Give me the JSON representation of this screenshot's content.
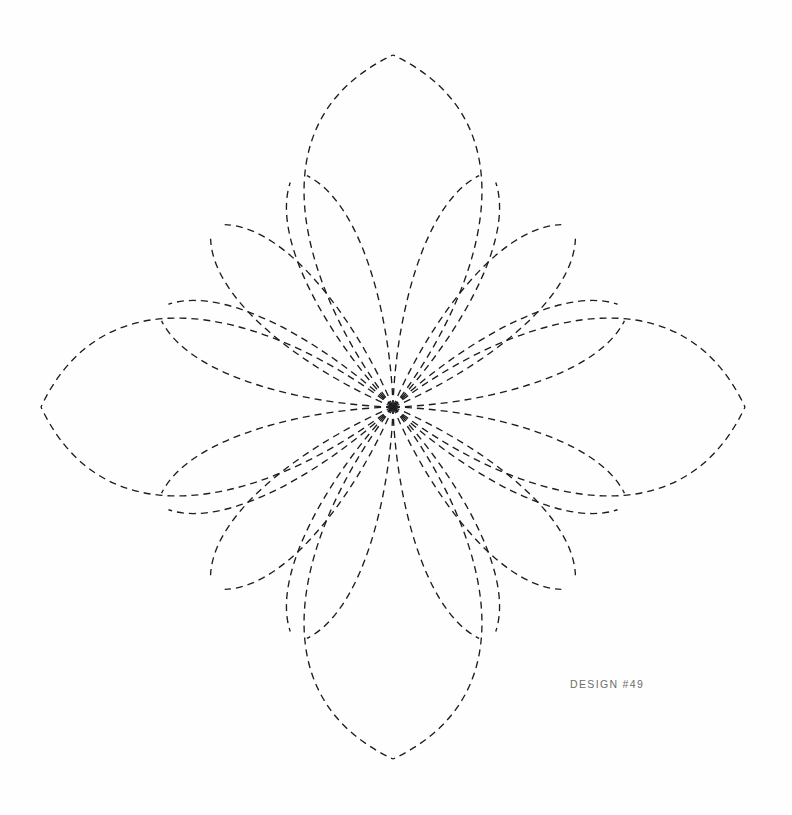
{
  "page": {
    "width": 792,
    "height": 815,
    "background_color": "#fefefe"
  },
  "caption": {
    "label": "DESIGN #49",
    "color": "#6d6d6d"
  },
  "pattern": {
    "name": "eight-point-floral-quilting-stencil",
    "description": "Eight-fold symmetric dashed quilting design: four pointed spikes on the cardinal axes and four leaf petals on the diagonals, all curves converging on a single center point.",
    "stroke_color": "#1d1d20",
    "stroke_width": 1.35,
    "dash_length": 7,
    "dash_gap": 5,
    "center": {
      "x": 393,
      "y": 407
    },
    "symmetry_order": 8,
    "spike_tips": [
      {
        "name": "north",
        "x": 393,
        "y": 55
      },
      {
        "name": "east",
        "x": 755,
        "y": 407
      },
      {
        "name": "south",
        "x": 393,
        "y": 758
      },
      {
        "name": "west",
        "x": 33,
        "y": 407
      }
    ],
    "petal_tips": [
      {
        "name": "northeast",
        "x": 568,
        "y": 170
      },
      {
        "name": "east-upper",
        "x": 638,
        "y": 234
      },
      {
        "name": "east-lower",
        "x": 638,
        "y": 578
      },
      {
        "name": "southeast",
        "x": 568,
        "y": 643
      },
      {
        "name": "southwest",
        "x": 215,
        "y": 643
      },
      {
        "name": "west-lower",
        "x": 148,
        "y": 578
      },
      {
        "name": "west-upper",
        "x": 148,
        "y": 234
      },
      {
        "name": "northwest",
        "x": 215,
        "y": 170
      }
    ],
    "arm_angles_deg": [
      -90,
      -67.5,
      -45,
      -22.5,
      0,
      22.5,
      45,
      67.5,
      90,
      112.5,
      135,
      157.5,
      180,
      202.5,
      225,
      247.5
    ]
  }
}
